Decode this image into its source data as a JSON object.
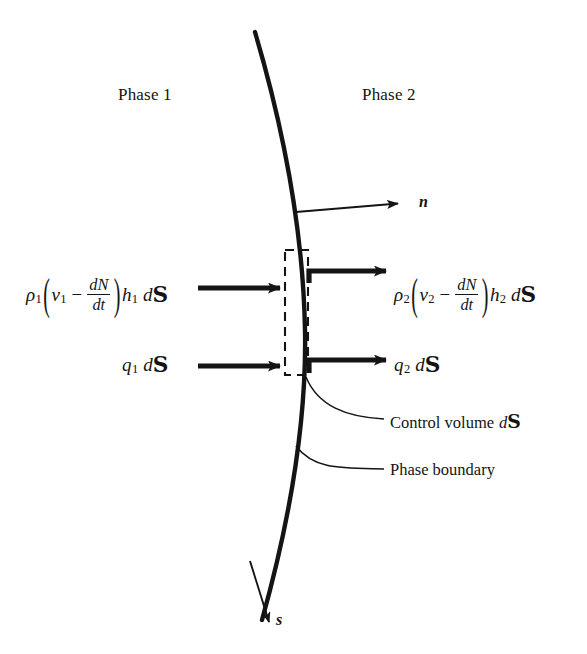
{
  "figure": {
    "width": 587,
    "height": 654,
    "background": "#ffffff",
    "ink": "#141414"
  },
  "regions": {
    "phase1": "Phase 1",
    "phase2": "Phase 2"
  },
  "callouts": {
    "control_volume": "Control volume dS",
    "control_volume_text": "Control volume",
    "phase_boundary": "Phase boundary"
  },
  "vectors": {
    "normal": "n",
    "tangent": "s"
  },
  "symbols": {
    "rho": "ρ",
    "minus": "−",
    "v": "v",
    "h": "h",
    "q": "q",
    "d": "d",
    "surface_element": "S",
    "dN": "dN",
    "dt": "dt",
    "sub1": "1",
    "sub2": "2",
    "paren_open": "(",
    "paren_close": ")"
  },
  "expressions": {
    "flux_in": "ρ₁(v₁ − dN/dt)h₁ dS",
    "flux_out": "ρ₂(v₂ − dN/dt)h₂ dS",
    "heat_in": "q₁ dS",
    "heat_out": "q₂ dS"
  },
  "geometry": {
    "boundary_curve": "M 255 32 C 281 120, 303 224, 305 330 C 307 432, 286 534, 262 620",
    "control_volume_box": {
      "x": 285,
      "y": 250,
      "width": 23,
      "height": 125
    },
    "normal_arrow": {
      "x1": 296,
      "y1": 212,
      "x2": 404,
      "y2": 203
    },
    "tangent_arrow": {
      "x1": 252,
      "y1": 566,
      "x2": 270,
      "y2": 628
    },
    "flux_in_arrow": {
      "x1": 200,
      "y1": 288,
      "x2": 286,
      "y2": 288
    },
    "flux_out_arrow": {
      "x1": 308,
      "y1": 271,
      "x2": 392,
      "y2": 271
    },
    "heat_in_arrow": {
      "x1": 200,
      "y1": 366,
      "x2": 286,
      "y2": 366
    },
    "heat_out_arrow": {
      "x1": 308,
      "y1": 360,
      "x2": 392,
      "y2": 360
    },
    "control_volume_leader": "M 305 378 C 318 404, 345 416, 385 418",
    "phase_boundary_leader": "M 296 448 C 312 468, 340 466, 385 468"
  }
}
